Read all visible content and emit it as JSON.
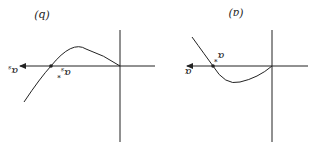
{
  "orientation": "rotated-180",
  "panels": [
    {
      "id": "b",
      "caption": "(b)",
      "axis_label": "α_s",
      "point_label": "α_s*",
      "axis_label_text": "α",
      "axis_label_sub": "s",
      "point_label_text": "α",
      "point_label_sub": "s",
      "point_label_sup": "*",
      "curve": "concave, crosses axis at α_s*, max between α_s* and origin"
    },
    {
      "id": "a",
      "caption": "(a)",
      "axis_label": "α",
      "point_label": "α*",
      "axis_label_text": "α",
      "point_label_text": "α",
      "point_label_sup": "*",
      "curve": "convex, crosses axis at α*, min between α* and origin"
    }
  ],
  "colors": {
    "line": "#222222",
    "background": "#ffffff"
  }
}
